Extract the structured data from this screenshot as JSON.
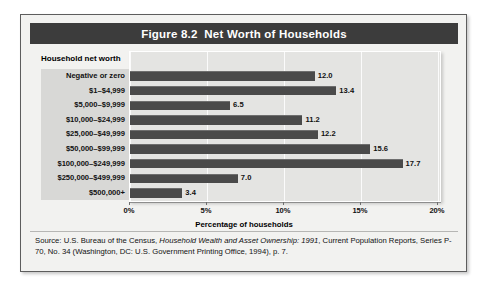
{
  "figure": {
    "title": "Figure 8.2  Net Worth of Households",
    "group_axis_label": "Household net worth",
    "x_axis_title": "Percentage of households",
    "source_prefix": "Source: U.S. Bureau of the Census, ",
    "source_italic": "Household Wealth and Asset Ownership: 1991",
    "source_suffix": ", Current Population Reports, Series P-70, No. 34 (Washington, DC: U.S. Government Printing Office, 1994), p. 7."
  },
  "colors": {
    "banner": "#3c3c3c",
    "banner_text": "#ffffff",
    "bar": "#4a4a4a",
    "plot_background": "#e4e4e2",
    "label_strip": "#d8d8d6",
    "frame_background": "#f2f2f0",
    "frame_border": "#5d5d5d",
    "gridline": "#fbfbfb"
  },
  "chart_data": {
    "type": "bar",
    "orientation": "horizontal",
    "title": "Figure 8.2  Net Worth of Households",
    "xlabel": "Percentage of households",
    "ylabel": "Household net worth",
    "xlim": [
      0,
      20
    ],
    "xticks": [
      0,
      5,
      10,
      15,
      20
    ],
    "xtick_labels": [
      "0%",
      "5%",
      "10%",
      "15%",
      "20%"
    ],
    "grid": true,
    "legend": "none",
    "categories": [
      "Negative or zero",
      "$1–$4,999",
      "$5,000–$9,999",
      "$10,000–$24,999",
      "$25,000–$49,999",
      "$50,000–$99,999",
      "$100,000–$249,999",
      "$250,000–$499,999",
      "$500,000+"
    ],
    "values": [
      12.0,
      13.4,
      6.5,
      11.2,
      12.2,
      15.6,
      17.7,
      7.0,
      3.4
    ],
    "value_labels": [
      "12.0",
      "13.4",
      "6.5",
      "11.2",
      "12.2",
      "15.6",
      "17.7",
      "7.0",
      "3.4"
    ]
  }
}
